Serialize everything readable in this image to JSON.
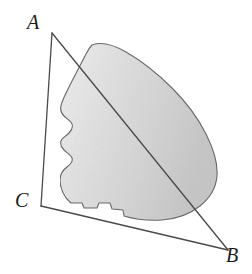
{
  "figure": {
    "kind": "geometry-diagram",
    "background_color": "#ffffff",
    "line_color": "#4a4a4a",
    "region_fill_light": "#ebebeb",
    "region_fill_mid": "#d9d9d9",
    "region_fill_dark": "#c9c9c9",
    "region_stroke_color": "#6b6b6b",
    "vertices": [
      {
        "id": "A",
        "label": "A",
        "x": 52,
        "y": 33,
        "label_x": 27,
        "label_y": 12
      },
      {
        "id": "B",
        "label": "B",
        "x": 228,
        "y": 250,
        "label_x": 226,
        "label_y": 245
      },
      {
        "id": "C",
        "label": "C",
        "x": 41,
        "y": 206,
        "label_x": 15,
        "label_y": 190
      }
    ],
    "edges": [
      {
        "id": "AC",
        "from": "A",
        "to": "C",
        "name": "edge-a-c"
      },
      {
        "id": "AB",
        "from": "A",
        "to": "B",
        "name": "edge-a-b"
      },
      {
        "id": "CB",
        "from": "C",
        "to": "B",
        "name": "edge-c-b"
      }
    ],
    "shaded_region": {
      "name": "shaded-region",
      "path": "M 92 45 C 100 42 112 44 126 52 C 140 60 158 74 172 88 C 186 102 198 118 206 134 C 214 150 218 164 217 176 C 216 188 210 198 200 206 C 190 214 176 219 162 220 C 148 221 134 219 124 216 L 123 210 L 112 209 L 110 203 L 99 203 L 97 208 L 84 208 L 82 203 L 71 203 L 66 198 C 62 192 60 186 60 180 C 60 174 63 170 67 167 C 71 164 73 161 72 158 C 71 155 67 153 64 150 C 61 147 60 144 61 141 C 62 138 66 136 69 133 C 72 130 73 127 72 124 C 71 121 67 119 64 116 C 61 113 60 110 61 106 C 62 100 66 93 71 83 C 76 73 82 62 86 54 C 88 50 90 47 92 45 Z"
    }
  }
}
